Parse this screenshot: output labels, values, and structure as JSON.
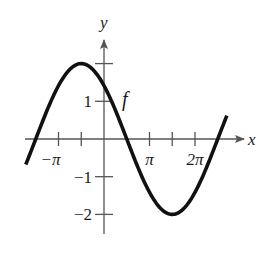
{
  "chart_data": {
    "type": "line",
    "title": "",
    "xlabel": "x",
    "ylabel": "y",
    "function_label": "f",
    "function": "f(x) = 2 sin(x/2 + 3π/4)",
    "xlim": [
      -3.5,
      3.05
    ],
    "xlim_units": "multiples of π",
    "ylim": [
      -2.5,
      2.6
    ],
    "x_ticks": [
      {
        "value": -1,
        "label": "−π"
      },
      {
        "value": -0.5,
        "label": ""
      },
      {
        "value": 1,
        "label": "π"
      },
      {
        "value": 1.5,
        "label": ""
      },
      {
        "value": 2,
        "label": "2π"
      }
    ],
    "y_ticks": [
      {
        "value": 2,
        "label": ""
      },
      {
        "value": 1,
        "label": "1"
      },
      {
        "value": -1,
        "label": "−1"
      },
      {
        "value": -2,
        "label": "−2"
      }
    ],
    "series": [
      {
        "name": "f",
        "x_start_pi": -1.72,
        "x_end_pi": 2.7,
        "key_points": [
          {
            "x": "-3π/2",
            "y": 0
          },
          {
            "x": "-π/2",
            "y": 2
          },
          {
            "x": "0",
            "y": 1.41
          },
          {
            "x": "π/2",
            "y": 0
          },
          {
            "x": "3π/2",
            "y": -2
          },
          {
            "x": "5π/2",
            "y": 0
          }
        ]
      }
    ],
    "grid": false,
    "legend": "none"
  }
}
